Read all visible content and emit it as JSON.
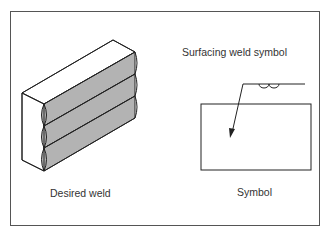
{
  "diagram": {
    "left_panel": {
      "caption": "Desired weld",
      "illustration": "block-with-three-surfacing-weld-beads",
      "bead_count": 3,
      "bead_fill": "#b3b3b3"
    },
    "right_panel": {
      "title": "Surfacing weld symbol",
      "caption": "Symbol",
      "symbol": "surfacing-weld-symbol",
      "elements": [
        "reference-line",
        "arrow-leader",
        "surfacing-beads-glyph",
        "part-outline-rectangle"
      ]
    },
    "colors": {
      "line": "#222222",
      "frame": "#555555",
      "text": "#333333",
      "bead_fill": "#b3b3b3"
    }
  }
}
